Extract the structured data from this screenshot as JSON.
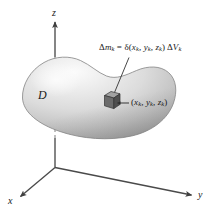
{
  "figure": {
    "background_color": "#ffffff",
    "width": 213,
    "height": 216
  },
  "axes": {
    "origin": {
      "x": 55,
      "y": 167
    },
    "z": {
      "label": "z",
      "tip": {
        "x": 55,
        "y": 20
      },
      "hidden_segment": {
        "from_y": 57,
        "to_y": 138,
        "style": "dashed"
      }
    },
    "x": {
      "label": "x",
      "tip": {
        "x": 18,
        "y": 198
      }
    },
    "y": {
      "label": "y",
      "tip": {
        "x": 193,
        "y": 196
      }
    },
    "line_color": "#4a4a4a"
  },
  "solid": {
    "label": "D",
    "shape": "kidney-shaped blob",
    "fill_light": "#f2f2f2",
    "fill_mid": "#c9c9c9",
    "fill_dark": "#9a9a9a",
    "outline_color": "#8c8c8c",
    "bounds": {
      "left": 22,
      "top": 57,
      "right": 176,
      "bottom": 138
    }
  },
  "mass_element": {
    "cube_center": {
      "x": 112,
      "y": 101
    },
    "cube_top_color": "#9c9c9c",
    "cube_front_color": "#6e6e6e",
    "cube_side_color": "#535353",
    "cube_edge_color": "#3a3a3a",
    "mass_formula": {
      "delta_m": "Δ",
      "m": "m",
      "k1": "k",
      "equals": " = ",
      "delta_fn": "δ",
      "open_paren": "(",
      "x": "x",
      "k2": "k",
      "comma1": ", ",
      "y": "y",
      "k3": "k",
      "comma2": ", ",
      "z": "z",
      "k4": "k",
      "close_paren": ") ",
      "delta_v": "Δ",
      "v": "V",
      "k5": "k",
      "plain": "Δmₖ = δ(xₖ, yₖ, zₖ) ΔVₖ"
    },
    "point_label": {
      "dash": "—",
      "open_paren": "(",
      "x": "x",
      "k1": "k",
      "comma1": ", ",
      "y": "y",
      "k2": "k",
      "comma2": ", ",
      "z": "z",
      "k3": "k",
      "close_paren": ")",
      "plain": "(xₖ, yₖ, zₖ)"
    },
    "leader_line": {
      "from": {
        "x": 129,
        "y": 57
      },
      "to": {
        "x": 114,
        "y": 93
      }
    },
    "pointer_line": {
      "from": {
        "x": 119,
        "y": 103
      },
      "to": {
        "x": 131,
        "y": 103
      }
    }
  }
}
